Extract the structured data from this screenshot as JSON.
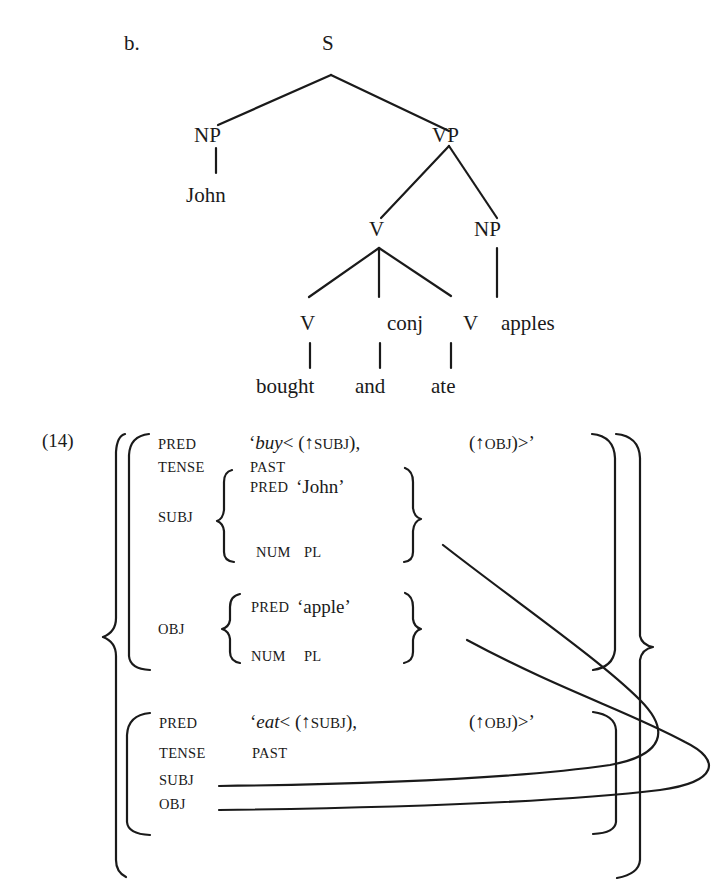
{
  "example_label": "b.",
  "tree": {
    "root": "S",
    "np_subject": "NP",
    "john": "John",
    "vp": "VP",
    "v_coord": "V",
    "np_object": "NP",
    "v1": "V",
    "conj": "conj",
    "v2": "V",
    "apples": "apples",
    "bought": "bought",
    "and": "and",
    "ate": "ate"
  },
  "fstructure": {
    "number": "(14)",
    "upper": {
      "pred_attr": "PRED",
      "pred_open": "‘",
      "pred_verb": "buy",
      "pred_args1": "< (",
      "arrow1": "↑",
      "subj_fn": "SUBJ",
      "pred_args1_close": "),",
      "pred_args2_open": "(",
      "arrow2": "↑",
      "obj_fn": "OBJ",
      "pred_args2_close": ")>’",
      "tense_attr": "TENSE",
      "tense_val": "PAST",
      "subj_attr": "SUBJ",
      "subj_pred_attr": "PRED",
      "subj_pred_val": "‘John’",
      "subj_num_attr": "NUM",
      "subj_num_val": "PL",
      "obj_attr": "OBJ",
      "obj_pred_attr": "PRED",
      "obj_pred_val": "‘apple’",
      "obj_num_attr": "NUM",
      "obj_num_val": "PL"
    },
    "lower": {
      "pred_attr": "PRED",
      "pred_open": "‘",
      "pred_verb": "eat",
      "pred_args1": "< (",
      "arrow1": "↑",
      "subj_fn": "SUBJ",
      "pred_args1_close": "),",
      "pred_args2_open": "(",
      "arrow2": "↑",
      "obj_fn": "OBJ",
      "pred_args2_close": ")>’",
      "tense_attr": "TENSE",
      "tense_val": "PAST",
      "subj_attr": "SUBJ",
      "obj_attr": "OBJ"
    }
  },
  "colors": {
    "ink": "#1a1a1a",
    "background": "#ffffff"
  }
}
